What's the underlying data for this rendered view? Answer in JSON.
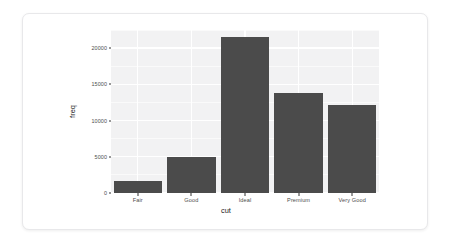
{
  "figure": {
    "card_background": "#ffffff",
    "panel_background": "#f2f2f3",
    "grid_color": "#ffffff",
    "bar_color": "#4b4b4b"
  },
  "chart_data": {
    "type": "bar",
    "title": "",
    "subtitle": "",
    "xlabel": "cut",
    "ylabel": "freq",
    "categories": [
      "Fair",
      "Good",
      "Ideal",
      "Premium",
      "Very Good"
    ],
    "values": [
      1610,
      4906,
      21551,
      13791,
      12082
    ],
    "ylim": [
      0,
      22500
    ],
    "xlim_categorical": true,
    "yticks": [
      0,
      5000,
      10000,
      15000,
      20000
    ],
    "ytick_labels": [
      "0",
      "5000",
      "10000",
      "15000",
      "20000"
    ],
    "xtick_labels": [
      "Fair",
      "Good",
      "Ideal",
      "Premium",
      "Very Good"
    ],
    "grid": {
      "major_horizontal": true,
      "minor_horizontal": true,
      "major_vertical": true,
      "minor_vertical": false
    },
    "legend": {
      "shown": false,
      "position": "none"
    },
    "annotations": []
  }
}
